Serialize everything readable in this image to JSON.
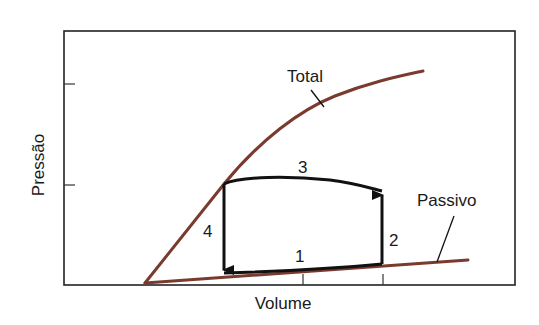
{
  "diagram": {
    "xlabel": "Volume",
    "ylabel": "Pressão",
    "curves": {
      "total": {
        "label": "Total",
        "color": "#7a3a2e"
      },
      "passive": {
        "label": "Passivo",
        "color": "#7a3a2e"
      }
    },
    "loop": {
      "color": "#111111",
      "phases": [
        {
          "id": "1",
          "label": "1"
        },
        {
          "id": "2",
          "label": "2"
        },
        {
          "id": "3",
          "label": "3"
        },
        {
          "id": "4",
          "label": "4"
        }
      ]
    },
    "axis_color": "#222222"
  }
}
